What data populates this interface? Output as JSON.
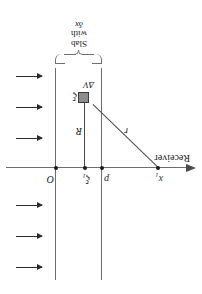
{
  "figure": {
    "type": "physics-diagram",
    "orientation": "rotated-180",
    "background_color": "#ffffff",
    "line_color": "#6e6e6e",
    "ink_color": "#1a1a1a",
    "cell_fill_color": "#8c8c8c"
  },
  "labels": {
    "receiver": "Receiver",
    "receiver_point": "x",
    "receiver_point_sub": "1",
    "boundary_left": "p",
    "scatter_point": "ξ",
    "scatter_point_sub": "1",
    "origin": "O",
    "distance_R": "R",
    "distance_r": "r",
    "cell_point": "ξ",
    "cell_volume": "ΔV"
  },
  "brace_caption": {
    "line1": "Slab",
    "line2": "with",
    "line3": "δx"
  },
  "incident_arrows": {
    "count": 6,
    "direction": "left",
    "y_positions": [
      26,
      57,
      88,
      155,
      186,
      217
    ],
    "x": 160,
    "length": 26
  },
  "geometry": {
    "axis_y": 126,
    "axis_x_start": 8,
    "axis_x_end": 196,
    "slab_left_x": 100,
    "slab_right_x": 146,
    "slab_top_y": 14,
    "slab_bottom_y": 226,
    "mid_line_x": 117,
    "points": [
      {
        "name": "x1",
        "x": 44,
        "y": 126
      },
      {
        "name": "p",
        "x": 100,
        "y": 126
      },
      {
        "name": "xi1",
        "x": 117,
        "y": 126
      },
      {
        "name": "O",
        "x": 146,
        "y": 126
      }
    ],
    "cell": {
      "x": 113,
      "y": 191,
      "size": 9
    }
  }
}
